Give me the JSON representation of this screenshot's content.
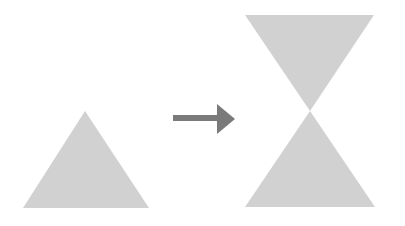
{
  "diagram": {
    "colors": {
      "shape_fill": "#d1d1d1",
      "arrow_fill": "#7a7a7a",
      "background": "#ffffff"
    },
    "shapes": {
      "source_triangle": {
        "points": "85,111 23,208 149,208"
      },
      "arrow": {
        "shaft": {
          "x": 173,
          "y": 115,
          "width": 45,
          "height": 6
        },
        "head": "217,104 235,119 217,134"
      },
      "result_top_triangle": {
        "points": "245,15 374,15 310,111"
      },
      "result_bottom_triangle": {
        "points": "310,111 245,207 375,207"
      }
    }
  }
}
